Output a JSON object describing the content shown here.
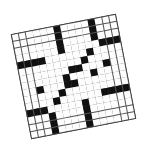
{
  "puzzle": {
    "type": "crossword",
    "rows": 15,
    "cols": 15,
    "rotation_deg": -11,
    "colors": {
      "white": "#fdfdfd",
      "black": "#111111",
      "line": "#555555"
    },
    "grid": [
      "......#....#...",
      "......#....#...",
      "......#....#...",
      "......#.....###",
      "####......#....",
      ".........#.....",
      ".......##...#..",
      "......#...#....",
      "..#...##.......",
      ".....#.........",
      "....#......####",
      "###.....#......",
      "...#....#......",
      "...#....#......",
      "...#....#......"
    ]
  }
}
